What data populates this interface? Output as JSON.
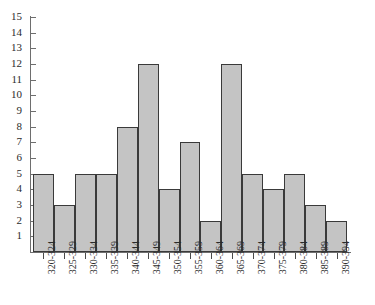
{
  "chart_data": {
    "type": "bar",
    "title": "",
    "subtitle": "",
    "xlabel": "",
    "ylabel": "",
    "categories": [
      "320-324",
      "325-329",
      "330-334",
      "335-339",
      "340-344",
      "345-349",
      "350-354",
      "355-359",
      "360-364",
      "365-369",
      "370-374",
      "375-379",
      "380-384",
      "385-389",
      "390-394"
    ],
    "values": [
      5,
      3,
      5,
      5,
      8,
      12,
      4,
      7,
      2,
      12,
      5,
      4,
      5,
      3,
      2
    ],
    "ylim": [
      0,
      15
    ],
    "ytick_labels": [
      "15",
      "14",
      "13",
      "12",
      "11",
      "10",
      "9",
      "8",
      "7",
      "6",
      "5",
      "4",
      "3",
      "2",
      "1"
    ],
    "ytick_values": [
      15,
      14,
      13,
      12,
      11,
      10,
      9,
      8,
      7,
      6,
      5,
      4,
      3,
      2,
      1
    ],
    "grid": false,
    "legend": [],
    "legend_position": "none",
    "bar_fill_color": "#c4c4c4",
    "bar_edge_color": "#3a3a3a",
    "axis_color": "#6e6e6e",
    "text_color": "#2b2b2b"
  }
}
